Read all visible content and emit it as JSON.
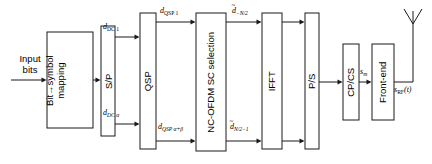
{
  "figure": {
    "kind": "block-diagram",
    "title_present": false,
    "background_color": "#ffffff",
    "line_color": "#1a1a1a",
    "width": 432,
    "height": 164
  },
  "input": {
    "label_line1": "Input",
    "label_line2": "bits"
  },
  "blocks": [
    {
      "id": "bit-symbol-mapping",
      "label_line1": "Bit→symbol",
      "label_line2": "mapping",
      "orientation": "vertical"
    },
    {
      "id": "sp",
      "label": "S/P",
      "orientation": "vertical"
    },
    {
      "id": "qsp",
      "label": "QSP",
      "orientation": "vertical"
    },
    {
      "id": "nc-ofdm-sc-selection",
      "label": "NC-OFDM SC selection",
      "orientation": "vertical"
    },
    {
      "id": "ifft",
      "label": "IFFT",
      "orientation": "vertical"
    },
    {
      "id": "ps",
      "label": "P/S",
      "orientation": "vertical"
    },
    {
      "id": "cp-cs",
      "label": "CP/CS",
      "orientation": "vertical"
    },
    {
      "id": "front-end",
      "label": "Front-end",
      "orientation": "vertical"
    }
  ],
  "signals": {
    "d_dc_1": {
      "base": "d",
      "sub": "DC 1"
    },
    "d_dc_alpha": {
      "base": "d",
      "sub": "DC α"
    },
    "d_qsp_1": {
      "base": "d",
      "sub": "QSP 1"
    },
    "d_qsp_alpha_beta": {
      "base": "d",
      "sub": "QSP α+β"
    },
    "d_tilde_minus_n2": {
      "base": "d",
      "accent": "~",
      "sub": "−N/2"
    },
    "d_tilde_n2_minus_1": {
      "base": "d",
      "accent": "~",
      "sub": "N/2−1"
    },
    "s_m": {
      "base": "s",
      "sub": "m"
    },
    "s_rf_t": {
      "base": "s",
      "sub": "RF",
      "suffix": "(t)"
    }
  },
  "antenna": {
    "name": "transmit-antenna",
    "shape": "dipole-v"
  }
}
